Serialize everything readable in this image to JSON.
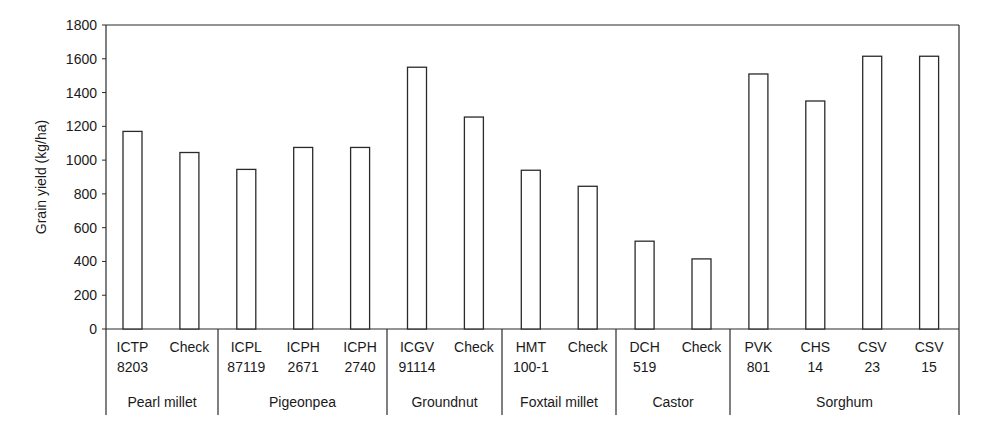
{
  "chart_data": {
    "type": "bar",
    "title": "",
    "xlabel": "",
    "ylabel": "Grain yield (kg/ha)",
    "ylim": [
      0,
      1800
    ],
    "yticks": [
      0,
      200,
      400,
      600,
      800,
      1000,
      1200,
      1400,
      1600,
      1800
    ],
    "grid": false,
    "legend": null,
    "categories": [
      {
        "line1": "ICTP",
        "line2": "8203",
        "group": "Pearl millet"
      },
      {
        "line1": "Check",
        "line2": "",
        "group": "Pearl millet"
      },
      {
        "line1": "ICPL",
        "line2": "87119",
        "group": "Pigeonpea"
      },
      {
        "line1": "ICPH",
        "line2": "2671",
        "group": "Pigeonpea"
      },
      {
        "line1": "ICPH",
        "line2": "2740",
        "group": "Pigeonpea"
      },
      {
        "line1": "ICGV",
        "line2": "91114",
        "group": "Groundnut"
      },
      {
        "line1": "Check",
        "line2": "",
        "group": "Groundnut"
      },
      {
        "line1": "HMT",
        "line2": "100-1",
        "group": "Foxtail millet"
      },
      {
        "line1": "Check",
        "line2": "",
        "group": "Foxtail millet"
      },
      {
        "line1": "DCH",
        "line2": "519",
        "group": "Castor"
      },
      {
        "line1": "Check",
        "line2": "",
        "group": "Castor"
      },
      {
        "line1": "PVK",
        "line2": "801",
        "group": "Sorghum"
      },
      {
        "line1": "CHS",
        "line2": "14",
        "group": "Sorghum"
      },
      {
        "line1": "CSV",
        "line2": "23",
        "group": "Sorghum"
      },
      {
        "line1": "CSV",
        "line2": "15",
        "group": "Sorghum"
      }
    ],
    "values": [
      1170,
      1045,
      945,
      1075,
      1075,
      1550,
      1255,
      940,
      845,
      520,
      415,
      1510,
      1350,
      1615,
      1615
    ],
    "groups": [
      {
        "name": "Pearl millet",
        "count": 2
      },
      {
        "name": "Pigeonpea",
        "count": 3
      },
      {
        "name": "Groundnut",
        "count": 2
      },
      {
        "name": "Foxtail millet",
        "count": 2
      },
      {
        "name": "Castor",
        "count": 2
      },
      {
        "name": "Sorghum",
        "count": 4
      }
    ],
    "colors": {
      "bar_fill": "#ffffff",
      "bar_stroke": "#2a2a2a",
      "axis": "#2a2a2a"
    }
  }
}
